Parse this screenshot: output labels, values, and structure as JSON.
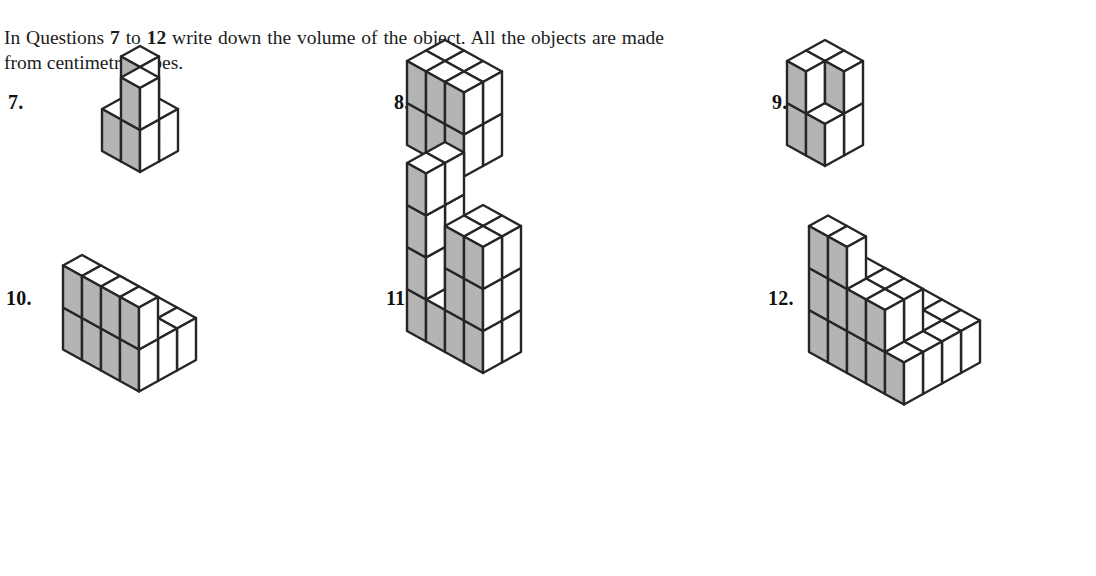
{
  "instructions": {
    "segment_1": "In Questions ",
    "bold_1": "7",
    "segment_2": " to ",
    "bold_2": "12",
    "segment_3": " write down the volume of the object. All the objects are made from centimetre cubes.",
    "full_text": "In Questions 7 to 12 write down the volume of the object. All the objects are made from centimetre cubes."
  },
  "style": {
    "background": "#ffffff",
    "edge_color": "#262626",
    "shaded_face_color": "#b4b4b4",
    "plain_face_color": "#ffffff",
    "text_color": "#1a1a1a"
  },
  "geometry": {
    "half_width": 19,
    "half_depth": 10.5,
    "cube_height": 42,
    "note": "isometric: x axis goes right-down, y axis goes left-down, z axis is vertical"
  },
  "questions": [
    {
      "number": "7.",
      "label_left": 8,
      "label_top": 92,
      "fig_left": 40,
      "fig_top": 100,
      "origin_x": 100,
      "origin_y": 30,
      "description": "2 by 2 base with two cubes on top forming an L / V notch",
      "volume_cubes": 6,
      "cubes": [
        {
          "x": 0,
          "y": 0,
          "z": 0
        },
        {
          "x": 1,
          "y": 0,
          "z": 0
        },
        {
          "x": 0,
          "y": 1,
          "z": 0
        },
        {
          "x": 1,
          "y": 1,
          "z": 0
        },
        {
          "x": 0,
          "y": 0,
          "z": 1
        },
        {
          "x": 1,
          "y": 1,
          "z": 1
        }
      ]
    },
    {
      "number": "8.",
      "label_left": 394,
      "label_top": 92,
      "fig_left": 415,
      "fig_top": 96,
      "origin_x": 30,
      "origin_y": 28,
      "description": "solid cuboid 3 wide by 2 deep by 2 high",
      "volume_cubes": 12,
      "cubes": [
        {
          "x": 0,
          "y": 0,
          "z": 0
        },
        {
          "x": 1,
          "y": 0,
          "z": 0
        },
        {
          "x": 2,
          "y": 0,
          "z": 0
        },
        {
          "x": 0,
          "y": 1,
          "z": 0
        },
        {
          "x": 1,
          "y": 1,
          "z": 0
        },
        {
          "x": 2,
          "y": 1,
          "z": 0
        },
        {
          "x": 0,
          "y": 0,
          "z": 1
        },
        {
          "x": 1,
          "y": 0,
          "z": 1
        },
        {
          "x": 2,
          "y": 0,
          "z": 1
        },
        {
          "x": 0,
          "y": 1,
          "z": 1
        },
        {
          "x": 1,
          "y": 1,
          "z": 1
        },
        {
          "x": 2,
          "y": 1,
          "z": 1
        }
      ]
    },
    {
      "number": "9.",
      "label_left": 772,
      "label_top": 92,
      "fig_left": 795,
      "fig_top": 96,
      "origin_x": 30,
      "origin_y": 28,
      "description": "2 by 2 base with a step: tall pair at back-left, single cube at right",
      "volume_cubes": 7,
      "cubes": [
        {
          "x": 0,
          "y": 0,
          "z": 0
        },
        {
          "x": 1,
          "y": 0,
          "z": 0
        },
        {
          "x": 0,
          "y": 1,
          "z": 0
        },
        {
          "x": 1,
          "y": 1,
          "z": 0
        },
        {
          "x": 0,
          "y": 0,
          "z": 1
        },
        {
          "x": 0,
          "y": 1,
          "z": 1
        },
        {
          "x": 1,
          "y": 0,
          "z": 1
        }
      ]
    },
    {
      "number": "10.",
      "label_left": 6,
      "label_top": 288,
      "fig_left": 40,
      "fig_top": 288,
      "origin_x": 80,
      "origin_y": 30,
      "description": "two-step staircase four cubes long",
      "volume_cubes": 16,
      "cubes": [
        {
          "x": 0,
          "y": 0,
          "z": 0
        },
        {
          "x": 1,
          "y": 0,
          "z": 0
        },
        {
          "x": 2,
          "y": 0,
          "z": 0
        },
        {
          "x": 3,
          "y": 0,
          "z": 0
        },
        {
          "x": 0,
          "y": 1,
          "z": 0
        },
        {
          "x": 1,
          "y": 1,
          "z": 0
        },
        {
          "x": 2,
          "y": 1,
          "z": 0
        },
        {
          "x": 3,
          "y": 1,
          "z": 0
        },
        {
          "x": 0,
          "y": 2,
          "z": 0
        },
        {
          "x": 1,
          "y": 2,
          "z": 0
        },
        {
          "x": 2,
          "y": 2,
          "z": 0
        },
        {
          "x": 3,
          "y": 2,
          "z": 0
        },
        {
          "x": 0,
          "y": 2,
          "z": 1
        },
        {
          "x": 1,
          "y": 2,
          "z": 1
        },
        {
          "x": 2,
          "y": 2,
          "z": 1
        },
        {
          "x": 3,
          "y": 2,
          "z": 1
        }
      ]
    },
    {
      "number": "11.",
      "label_left": 386,
      "label_top": 288,
      "fig_left": 415,
      "fig_top": 288,
      "origin_x": 30,
      "origin_y": 22,
      "description": "U shape: two towers four cubes high joined by a one-high base row",
      "volume_cubes": 22,
      "cubes": [
        {
          "x": 0,
          "y": 0,
          "z": 0
        },
        {
          "x": 1,
          "y": 0,
          "z": 0
        },
        {
          "x": 2,
          "y": 0,
          "z": 0
        },
        {
          "x": 3,
          "y": 0,
          "z": 0
        },
        {
          "x": 0,
          "y": 1,
          "z": 0
        },
        {
          "x": 1,
          "y": 1,
          "z": 0
        },
        {
          "x": 2,
          "y": 1,
          "z": 0
        },
        {
          "x": 3,
          "y": 1,
          "z": 0
        },
        {
          "x": 0,
          "y": 0,
          "z": 1
        },
        {
          "x": 0,
          "y": 1,
          "z": 1
        },
        {
          "x": 3,
          "y": 0,
          "z": 1
        },
        {
          "x": 3,
          "y": 1,
          "z": 1
        },
        {
          "x": 0,
          "y": 0,
          "z": 2
        },
        {
          "x": 0,
          "y": 1,
          "z": 2
        },
        {
          "x": 3,
          "y": 0,
          "z": 2
        },
        {
          "x": 3,
          "y": 1,
          "z": 2
        },
        {
          "x": 0,
          "y": 0,
          "z": 3
        },
        {
          "x": 0,
          "y": 1,
          "z": 3
        },
        {
          "x": 2,
          "y": 0,
          "z": 1
        },
        {
          "x": 2,
          "y": 1,
          "z": 1
        },
        {
          "x": 2,
          "y": 0,
          "z": 2
        },
        {
          "x": 2,
          "y": 1,
          "z": 2
        }
      ]
    },
    {
      "number": "12.",
      "label_left": 768,
      "label_top": 288,
      "fig_left": 790,
      "fig_top": 288,
      "origin_x": 95,
      "origin_y": 22,
      "description": "three-level staircase pyramid five cubes long",
      "volume_cubes": 30,
      "cubes": [
        {
          "x": 0,
          "y": 0,
          "z": 0
        },
        {
          "x": 1,
          "y": 0,
          "z": 0
        },
        {
          "x": 2,
          "y": 0,
          "z": 0
        },
        {
          "x": 3,
          "y": 0,
          "z": 0
        },
        {
          "x": 4,
          "y": 0,
          "z": 0
        },
        {
          "x": 0,
          "y": 1,
          "z": 0
        },
        {
          "x": 1,
          "y": 1,
          "z": 0
        },
        {
          "x": 2,
          "y": 1,
          "z": 0
        },
        {
          "x": 3,
          "y": 1,
          "z": 0
        },
        {
          "x": 4,
          "y": 1,
          "z": 0
        },
        {
          "x": 0,
          "y": 2,
          "z": 0
        },
        {
          "x": 1,
          "y": 2,
          "z": 0
        },
        {
          "x": 2,
          "y": 2,
          "z": 0
        },
        {
          "x": 3,
          "y": 2,
          "z": 0
        },
        {
          "x": 4,
          "y": 2,
          "z": 0
        },
        {
          "x": 0,
          "y": 3,
          "z": 0
        },
        {
          "x": 1,
          "y": 3,
          "z": 0
        },
        {
          "x": 2,
          "y": 3,
          "z": 0
        },
        {
          "x": 3,
          "y": 3,
          "z": 0
        },
        {
          "x": 4,
          "y": 3,
          "z": 0
        },
        {
          "x": 0,
          "y": 2,
          "z": 1
        },
        {
          "x": 1,
          "y": 2,
          "z": 1
        },
        {
          "x": 2,
          "y": 2,
          "z": 1
        },
        {
          "x": 3,
          "y": 2,
          "z": 1
        },
        {
          "x": 0,
          "y": 3,
          "z": 1
        },
        {
          "x": 1,
          "y": 3,
          "z": 1
        },
        {
          "x": 2,
          "y": 3,
          "z": 1
        },
        {
          "x": 3,
          "y": 3,
          "z": 1
        },
        {
          "x": 0,
          "y": 3,
          "z": 2
        },
        {
          "x": 1,
          "y": 3,
          "z": 2
        }
      ]
    }
  ]
}
